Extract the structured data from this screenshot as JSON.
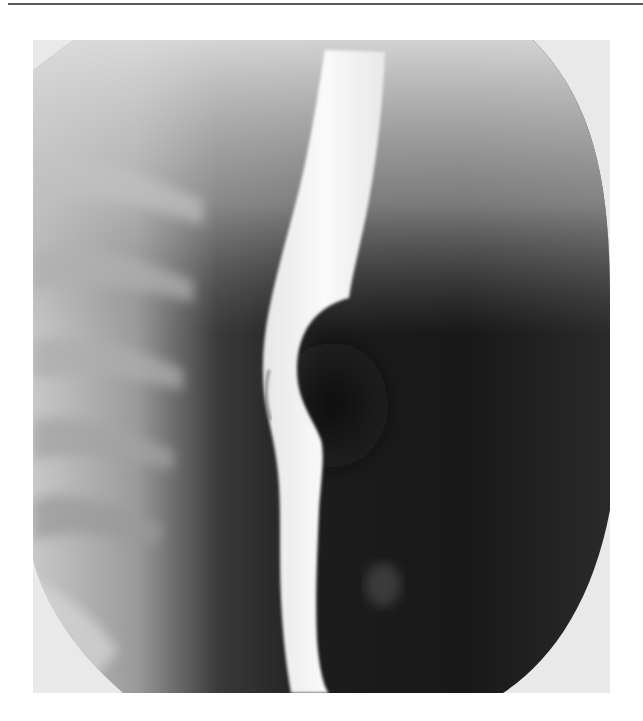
{
  "page": {
    "top_rule": {
      "color": "#5a5a5a"
    }
  },
  "figure": {
    "type": "radiograph",
    "modality": "barium swallow fluoroscopy",
    "view": "lateral/oblique esophagram",
    "colors": {
      "background_field": "#e9e9e9",
      "dark_soft_tissue": "#151515",
      "contrast_column": "#f4f4f4",
      "spine_gray": "#a8a8a8"
    }
  }
}
